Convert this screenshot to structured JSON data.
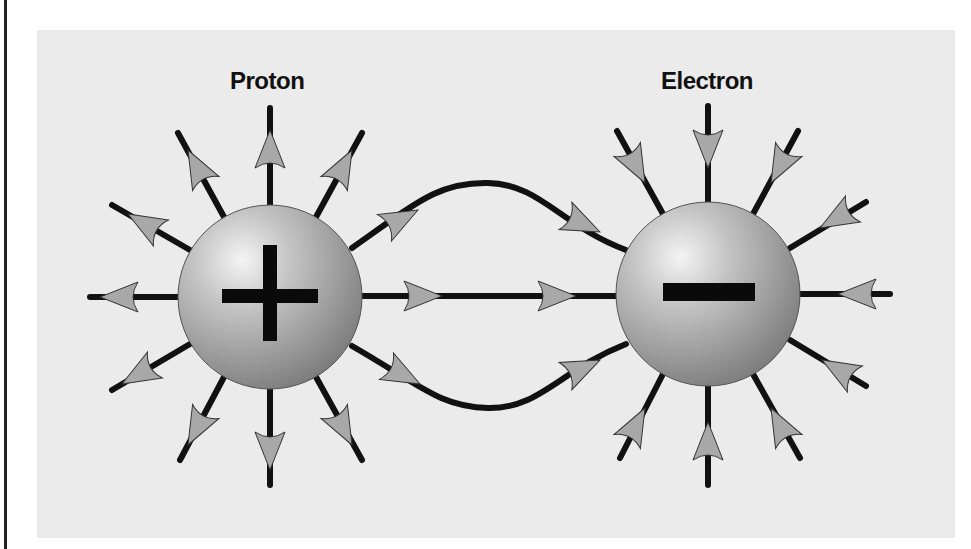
{
  "diagram": {
    "colors": {
      "background": "#ffffff",
      "panel": "#ebebeb",
      "line": "#111111",
      "arrow_fill": "#a8a8a8",
      "sphere_light": "#f2f2f2",
      "sphere_dark": "#7a7a7a"
    },
    "charges": [
      {
        "id": "proton",
        "label": "Proton",
        "sign": "+",
        "center": [
          270,
          297
        ],
        "radius": 92,
        "field_direction": "outward"
      },
      {
        "id": "electron",
        "label": "Electron",
        "sign": "−",
        "center": [
          708,
          294
        ],
        "radius": 92,
        "field_direction": "inward"
      }
    ],
    "connecting_lines": [
      {
        "id": "upper-arc",
        "direction": "proton-to-electron"
      },
      {
        "id": "middle-line",
        "direction": "proton-to-electron"
      },
      {
        "id": "lower-arc",
        "direction": "proton-to-electron"
      }
    ]
  }
}
